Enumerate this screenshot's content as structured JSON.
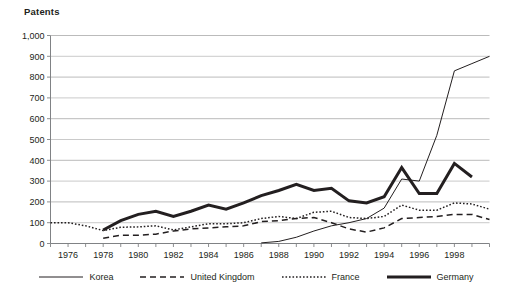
{
  "chart_data": {
    "type": "line",
    "title": "Patents",
    "xlabel": "",
    "ylabel": "Patents",
    "xlim": [
      1975,
      2000
    ],
    "ylim": [
      0,
      1000
    ],
    "ytick_labels": [
      "0",
      "100",
      "200",
      "300",
      "400",
      "500",
      "600",
      "700",
      "800",
      "900",
      "1,000"
    ],
    "ytick_values": [
      0,
      100,
      200,
      300,
      400,
      500,
      600,
      700,
      800,
      900,
      1000
    ],
    "xtick_labels": [
      "1976",
      "1978",
      "1980",
      "1982",
      "1984",
      "1986",
      "1988",
      "1990",
      "1992",
      "1994",
      "1996",
      "1998"
    ],
    "xtick_values": [
      1976,
      1978,
      1980,
      1982,
      1984,
      1986,
      1988,
      1990,
      1992,
      1994,
      1996,
      1998
    ],
    "grid": "horizontal",
    "legend_position": "bottom",
    "x": [
      1975,
      1976,
      1977,
      1978,
      1979,
      1980,
      1981,
      1982,
      1983,
      1984,
      1985,
      1986,
      1987,
      1988,
      1989,
      1990,
      1991,
      1992,
      1993,
      1994,
      1995,
      1996,
      1997,
      1998,
      1999,
      2000
    ],
    "series": [
      {
        "name": "Korea",
        "style": "solid-thin",
        "color": "#231f20",
        "x": [
          1987,
          1988,
          1989,
          1990,
          1991,
          1992,
          1993,
          1994,
          1995,
          1996,
          1997,
          1998,
          1999,
          2000
        ],
        "values": [
          3,
          10,
          30,
          60,
          85,
          100,
          120,
          170,
          310,
          300,
          520,
          830,
          865,
          900
        ]
      },
      {
        "name": "United Kingdom",
        "style": "dashed",
        "color": "#231f20",
        "x": [
          1978,
          1979,
          1980,
          1981,
          1982,
          1983,
          1984,
          1985,
          1986,
          1987,
          1988,
          1989,
          1990,
          1991,
          1992,
          1993,
          1994,
          1995,
          1996,
          1997,
          1998,
          1999,
          2000
        ],
        "values": [
          25,
          40,
          40,
          45,
          60,
          70,
          75,
          80,
          85,
          105,
          110,
          120,
          125,
          100,
          70,
          55,
          75,
          120,
          125,
          130,
          140,
          140,
          115
        ]
      },
      {
        "name": "France",
        "style": "dotted",
        "color": "#231f20",
        "x": [
          1975,
          1976,
          1977,
          1978,
          1979,
          1980,
          1981,
          1982,
          1983,
          1984,
          1985,
          1986,
          1987,
          1988,
          1989,
          1990,
          1991,
          1992,
          1993,
          1994,
          1995,
          1996,
          1997,
          1998,
          1999,
          2000
        ],
        "values": [
          100,
          100,
          85,
          62,
          78,
          80,
          85,
          65,
          80,
          95,
          95,
          100,
          120,
          130,
          120,
          150,
          155,
          125,
          120,
          130,
          185,
          160,
          160,
          195,
          190,
          165
        ]
      },
      {
        "name": "Germany",
        "style": "solid-thick",
        "color": "#231f20",
        "x": [
          1978,
          1979,
          1980,
          1981,
          1982,
          1983,
          1984,
          1985,
          1986,
          1987,
          1988,
          1989,
          1990,
          1991,
          1992,
          1993,
          1994,
          1995,
          1996,
          1997,
          1998,
          1999
        ],
        "values": [
          65,
          110,
          140,
          155,
          130,
          155,
          185,
          165,
          195,
          230,
          255,
          285,
          255,
          265,
          205,
          195,
          225,
          365,
          240,
          240,
          385,
          320
        ]
      }
    ]
  },
  "legend": {
    "items": [
      {
        "label": "Korea",
        "swatch": "solid-thin"
      },
      {
        "label": "United Kingdom",
        "swatch": "dashed"
      },
      {
        "label": "France",
        "swatch": "dotted"
      },
      {
        "label": "Germany",
        "swatch": "solid-thick"
      }
    ]
  },
  "axis_color": "#808285",
  "grid_color": "#b3b3b3",
  "line_color": "#231f20"
}
